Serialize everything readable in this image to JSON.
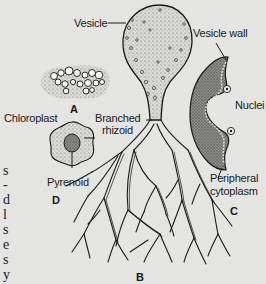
{
  "figure": {
    "parts": {
      "A": {
        "letter": "A"
      },
      "B": {
        "letter": "B"
      },
      "C": {
        "letter": "C"
      },
      "D": {
        "letter": "D"
      }
    },
    "labels": {
      "vesicle": "Vesicle",
      "vesicle_wall": "Vesicle wall",
      "chloroplast": "Chloroplast",
      "branched_rhizoid_line1": "Branched",
      "branched_rhizoid_line2": "rhizoid",
      "nuclei": "Nuclei",
      "pyrenoid": "Pyrenoid",
      "peripheral_cytoplasm_line1": "Peripheral",
      "peripheral_cytoplasm_line2": "cytoplasm"
    },
    "edge_text_fragments": [
      "s",
      "-",
      "d",
      "l",
      "s",
      "e",
      "s",
      "y"
    ],
    "colors": {
      "background": "#e4e4e2",
      "ink": "#1a1a1a",
      "stipple_fill": "#c9c9c6",
      "dark_fill": "#7a7a76"
    }
  }
}
